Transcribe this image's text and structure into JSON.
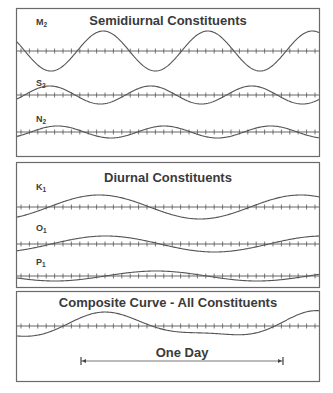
{
  "panels": [
    {
      "id": "semidiurnal",
      "title": "Semidiurnal Constituents",
      "constituents": [
        {
          "name": "M",
          "subscript": "2",
          "period_hours": 12.42,
          "relative_amplitude": 1.0,
          "phase_deg": 0
        },
        {
          "name": "S",
          "subscript": "2",
          "period_hours": 12.0,
          "relative_amplitude": 0.45,
          "phase_deg": 180
        },
        {
          "name": "N",
          "subscript": "2",
          "period_hours": 12.66,
          "relative_amplitude": 0.3,
          "phase_deg": 200
        }
      ]
    },
    {
      "id": "diurnal",
      "title": "Diurnal Constituents",
      "constituents": [
        {
          "name": "K",
          "subscript": "1",
          "period_hours": 23.93,
          "relative_amplitude": 0.6,
          "phase_deg": 210
        },
        {
          "name": "O",
          "subscript": "1",
          "period_hours": 25.82,
          "relative_amplitude": 0.4,
          "phase_deg": 210
        },
        {
          "name": "P",
          "subscript": "1",
          "period_hours": 24.07,
          "relative_amplitude": 0.25,
          "phase_deg": 310
        }
      ]
    },
    {
      "id": "composite",
      "title": "Composite Curve - All Constituents",
      "constituents": []
    }
  ],
  "span_annotation": {
    "label": "One Day",
    "duration_hours": 24
  }
}
